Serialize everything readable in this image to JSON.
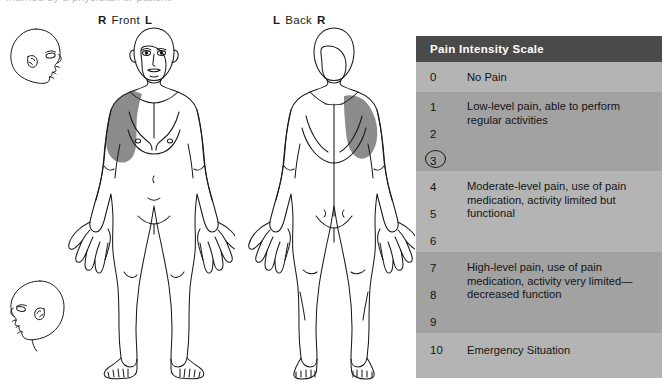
{
  "page": {
    "cut_off_top_text": "marked by a physician or patient"
  },
  "figures": {
    "front": {
      "left_label": "L",
      "right_label": "R",
      "center_label": "Front",
      "shaded_region": "right-shoulder-deltoid",
      "shade_color": "#8c8c8c"
    },
    "back": {
      "left_label": "L",
      "right_label": "R",
      "center_label": "Back",
      "shaded_region": "right-shoulder-scapula",
      "shade_color": "#8c8c8c"
    },
    "head_top_name": "head-profile-facing-right",
    "head_bottom_name": "head-profile-facing-left"
  },
  "pain_scale": {
    "title": "Pain Intensity Scale",
    "header_bg": "#4a4a4a",
    "header_fg": "#ffffff",
    "band_light": "#b4b4b4",
    "band_dark": "#a2a2a2",
    "selected_value": "3",
    "bands": [
      {
        "numbers": [
          "0"
        ],
        "description": "No Pain",
        "shade": "light"
      },
      {
        "numbers": [
          "1",
          "2",
          "3"
        ],
        "description": "Low-level pain, able to perform regular activities",
        "shade": "dark"
      },
      {
        "numbers": [
          "4",
          "5",
          "6"
        ],
        "description": "Moderate-level pain, use of pain medication, activity limited but functional",
        "shade": "light"
      },
      {
        "numbers": [
          "7",
          "8",
          "9"
        ],
        "description": "High-level pain, use of pain medication, activity very limited—decreased function",
        "shade": "dark"
      },
      {
        "numbers": [
          "10"
        ],
        "description": "Emergency Situation",
        "shade": "light"
      }
    ]
  }
}
